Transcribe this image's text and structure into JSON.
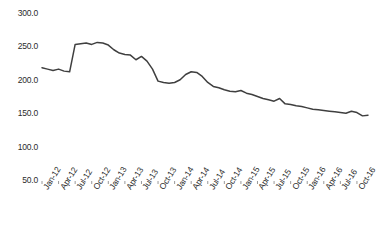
{
  "chart_data": {
    "type": "line",
    "title": "",
    "subtitle": "",
    "xlabel": "",
    "ylabel": "",
    "ylim": [
      50.0,
      300.0
    ],
    "y_ticks": [
      300.0,
      250.0,
      200.0,
      150.0,
      100.0,
      50.0
    ],
    "y_tick_labels": [
      "300.0",
      "250.0",
      "200.0",
      "150.0",
      "100.0",
      "50.0"
    ],
    "grid": false,
    "legend": false,
    "legend_position": "none",
    "line_color": "#3f3f3f",
    "x_tick_labels": [
      "Jan-12",
      "Apr-12",
      "Jul-12",
      "Oct-12",
      "Jan-13",
      "Apr-13",
      "Jul-13",
      "Oct-13",
      "Jan-14",
      "Apr-14",
      "Jul-14",
      "Oct-14",
      "Jan-15",
      "Apr-15",
      "Jul-15",
      "Oct-15",
      "Jan-16",
      "Apr-16",
      "Jul-16",
      "Oct-16"
    ],
    "x": [
      "Jan-12",
      "Feb-12",
      "Mar-12",
      "Apr-12",
      "May-12",
      "Jun-12",
      "Jul-12",
      "Aug-12",
      "Sep-12",
      "Oct-12",
      "Nov-12",
      "Dec-12",
      "Jan-13",
      "Feb-13",
      "Mar-13",
      "Apr-13",
      "May-13",
      "Jun-13",
      "Jul-13",
      "Aug-13",
      "Sep-13",
      "Oct-13",
      "Nov-13",
      "Dec-13",
      "Jan-14",
      "Feb-14",
      "Mar-14",
      "Apr-14",
      "May-14",
      "Jun-14",
      "Jul-14",
      "Aug-14",
      "Sep-14",
      "Oct-14",
      "Nov-14",
      "Dec-14",
      "Jan-15",
      "Feb-15",
      "Mar-15",
      "Apr-15",
      "May-15",
      "Jun-15",
      "Jul-15",
      "Aug-15",
      "Sep-15",
      "Oct-15",
      "Nov-15",
      "Dec-15",
      "Jan-16",
      "Feb-16",
      "Mar-16",
      "Apr-16",
      "May-16",
      "Jun-16",
      "Jul-16",
      "Aug-16",
      "Sep-16",
      "Oct-16",
      "Nov-16",
      "Dec-16"
    ],
    "values": [
      218,
      216,
      214,
      216,
      213,
      212,
      253,
      254,
      255,
      253,
      256,
      255,
      252,
      245,
      240,
      238,
      237,
      230,
      235,
      228,
      216,
      198,
      196,
      195,
      196,
      200,
      208,
      212,
      211,
      205,
      196,
      190,
      188,
      185,
      183,
      182,
      184,
      180,
      178,
      175,
      172,
      170,
      168,
      172,
      164,
      163,
      161,
      160,
      158,
      156,
      155,
      154,
      153,
      152,
      151,
      150,
      153,
      151,
      146,
      147
    ]
  }
}
